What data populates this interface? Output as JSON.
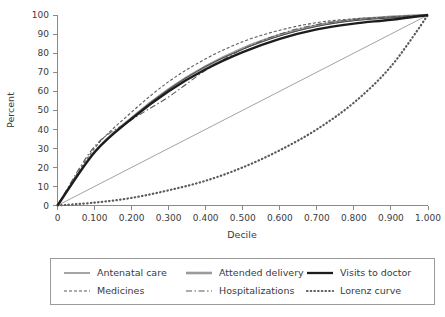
{
  "chart_data": {
    "type": "line",
    "title": "",
    "xlabel": "Decile",
    "ylabel": "Percent",
    "xlim": [
      0,
      1.0
    ],
    "ylim": [
      0,
      100
    ],
    "grid": false,
    "legend_position": "below-plot",
    "x_tick_labels": [
      "0",
      "0.100",
      "0.200",
      "0.300",
      "0.400",
      "0.500",
      "0.600",
      "0.700",
      "0.800",
      "0.900",
      "1.000"
    ],
    "x_tick_values": [
      0,
      0.1,
      0.2,
      0.3,
      0.4,
      0.5,
      0.6,
      0.7,
      0.8,
      0.9,
      1.0
    ],
    "y_tick_labels": [
      "0",
      "10",
      "20",
      "30",
      "40",
      "50",
      "60",
      "70",
      "80",
      "90",
      "100"
    ],
    "y_tick_values": [
      0,
      10,
      20,
      30,
      40,
      50,
      60,
      70,
      80,
      90,
      100
    ],
    "x": [
      0,
      0.1,
      0.2,
      0.3,
      0.4,
      0.5,
      0.6,
      0.7,
      0.8,
      0.9,
      1.0
    ],
    "series": [
      {
        "name": "Antenatal care",
        "style": "solid-thin",
        "color": "#4a4a4a",
        "width": 1.0,
        "values": [
          0,
          28,
          46,
          61,
          73,
          82,
          89,
          94,
          97,
          98.5,
          100
        ]
      },
      {
        "name": "Attended delivery",
        "style": "solid-thick-gray",
        "color": "#9b9b9b",
        "width": 2.6,
        "values": [
          0,
          28,
          46,
          61,
          73,
          82.5,
          89.5,
          94.5,
          97.5,
          99,
          100
        ]
      },
      {
        "name": "Visits to doctor",
        "style": "solid-thick-black",
        "color": "#1d1d1d",
        "width": 2.3,
        "values": [
          0,
          28,
          45.5,
          60,
          71.5,
          80.5,
          87.5,
          92.5,
          95.5,
          97.5,
          100
        ]
      },
      {
        "name": "Medicines",
        "style": "dotted-dash",
        "color": "#5a5a5a",
        "width": 1.1,
        "values": [
          0,
          30,
          49,
          65,
          77,
          86,
          92,
          96,
          98,
          99,
          100
        ]
      },
      {
        "name": "Hospitalizations",
        "style": "dash-dot",
        "color": "#5a5a5a",
        "width": 1.1,
        "values": [
          0,
          31,
          45,
          57,
          71,
          82,
          90,
          95,
          97.5,
          99,
          100
        ]
      },
      {
        "name": "Lorenz curve",
        "style": "dotted",
        "color": "#5a5a5a",
        "width": 2.2,
        "values": [
          0,
          1.5,
          4,
          8,
          13,
          20,
          29,
          40,
          54,
          73,
          100
        ]
      }
    ],
    "reference_line": {
      "name": "line-of-equality",
      "from": [
        0,
        0
      ],
      "to": [
        1.0,
        100
      ],
      "color": "#8a8a8a",
      "width": 0.8
    }
  },
  "legend": {
    "entries": [
      {
        "label": "Antenatal care",
        "series": 0
      },
      {
        "label": "Attended delivery",
        "series": 1
      },
      {
        "label": "Visits to doctor",
        "series": 2
      },
      {
        "label": "Medicines",
        "series": 3
      },
      {
        "label": "Hospitalizations",
        "series": 4
      },
      {
        "label": "Lorenz curve",
        "series": 5
      }
    ]
  }
}
